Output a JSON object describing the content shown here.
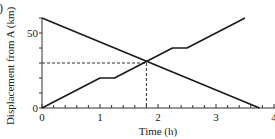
{
  "panel_label": ")",
  "chart_data": {
    "type": "line",
    "title": "",
    "xlabel": "Time (h)",
    "ylabel": "Displacement from A (km)",
    "xlim": [
      0,
      4
    ],
    "ylim": [
      0,
      60
    ],
    "x_ticks": [
      0,
      1,
      2,
      3,
      4
    ],
    "x_tick_labels": [
      "0",
      "1",
      "2",
      "3",
      "4"
    ],
    "x_minor_step": 0.2,
    "y_ticks": [
      0,
      50
    ],
    "y_tick_labels": [
      "0",
      "50"
    ],
    "y_minor_step": 10,
    "grid": false,
    "series": [
      {
        "name": "Travelling away from A",
        "style": "solid",
        "x": [
          0,
          1,
          1.25,
          2.25,
          2.5,
          3.5
        ],
        "y": [
          0,
          20,
          20,
          40,
          40,
          60
        ]
      },
      {
        "name": "Travelling towards A",
        "style": "solid",
        "x": [
          0,
          3.75
        ],
        "y": [
          60,
          0
        ]
      }
    ],
    "annotations": [
      {
        "type": "dashed-guide",
        "name": "meeting point",
        "x": 1.8,
        "y": 30
      }
    ],
    "colors": {
      "line": "#1a1a1a",
      "axis": "#333333",
      "guide": "#333333"
    }
  }
}
